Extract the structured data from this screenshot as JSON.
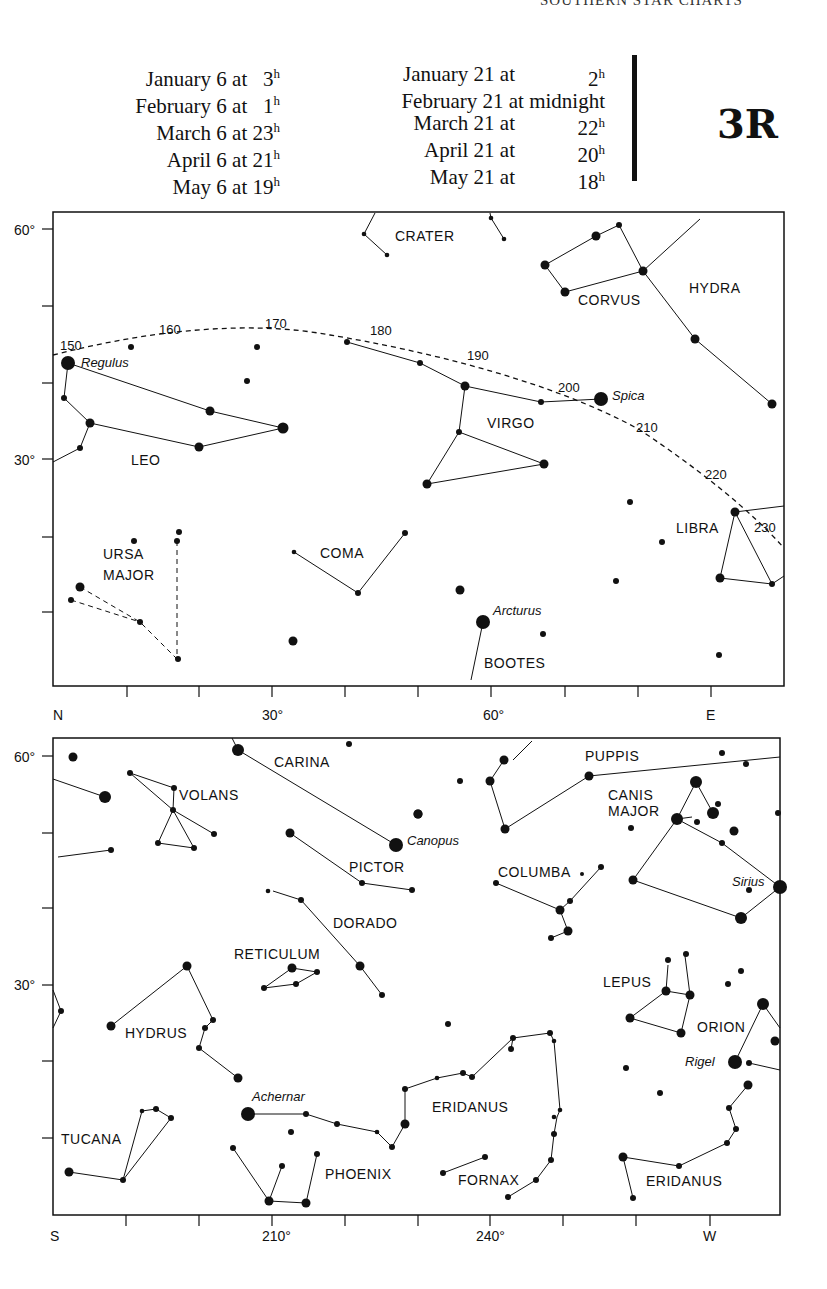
{
  "header": {
    "running_head": "SOUTHERN STAR CHARTS",
    "plate_id": "3R",
    "times_col1": [
      {
        "text": "January 6 at",
        "hour": "3",
        "unit": "h"
      },
      {
        "text": "February 6 at",
        "hour": "1",
        "unit": "h"
      },
      {
        "text": "March 6 at",
        "hour": "23",
        "unit": "h"
      },
      {
        "text": "April 6 at",
        "hour": "21",
        "unit": "h"
      },
      {
        "text": "May 6 at",
        "hour": "19",
        "unit": "h"
      }
    ],
    "times_col2": [
      {
        "text": "January 21 at",
        "hour": "2",
        "unit": "h"
      },
      {
        "text": "February 21 at midnight",
        "hour": "",
        "unit": ""
      },
      {
        "text": "March 21 at",
        "hour": "22",
        "unit": "h"
      },
      {
        "text": "April 21 at",
        "hour": "20",
        "unit": "h"
      },
      {
        "text": "May 21 at",
        "hour": "18",
        "unit": "h"
      }
    ]
  },
  "chart_north": {
    "y_ticks": [
      "60°",
      "30°"
    ],
    "x_labels": [
      "N",
      "30°",
      "60°",
      "E"
    ],
    "constellations": [
      "CRATER",
      "CORVUS",
      "HYDRA",
      "LEO",
      "VIRGO",
      "LIBRA",
      "URSA",
      "MAJOR",
      "COMA",
      "BOOTES"
    ],
    "stars": [
      "Regulus",
      "Spica",
      "Arcturus"
    ],
    "ecliptic_marks": [
      "150",
      "160",
      "170",
      "180",
      "190",
      "200",
      "210",
      "220",
      "230"
    ]
  },
  "chart_south": {
    "y_ticks": [
      "60°",
      "30°"
    ],
    "x_labels": [
      "S",
      "210°",
      "240°",
      "W"
    ],
    "constellations": [
      "CARINA",
      "VOLANS",
      "PICTOR",
      "DORADO",
      "RETICULUM",
      "HYDRUS",
      "TUCANA",
      "PHOENIX",
      "ERIDANUS",
      "FORNAX",
      "COLUMBA",
      "PUPPIS",
      "CANIS",
      "MAJOR",
      "LEPUS",
      "ORION",
      "ERIDANUS"
    ],
    "stars": [
      "Canopus",
      "Achernar",
      "Sirius",
      "Rigel"
    ]
  }
}
